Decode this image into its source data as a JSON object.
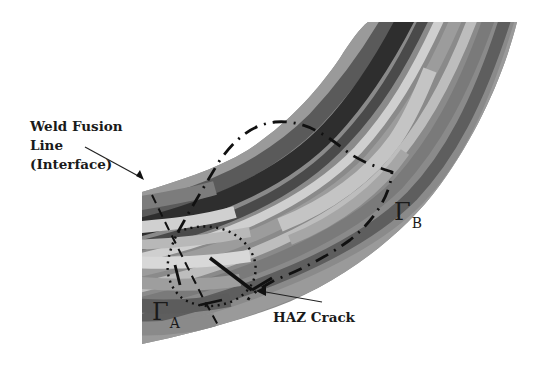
{
  "figure": {
    "labels": {
      "weld_fusion_line": [
        "Weld Fusion",
        "Line",
        "(Interface)"
      ],
      "haz_crack": "HAZ Crack",
      "gamma_b": {
        "symbol": "Γ",
        "subscript": "B"
      },
      "gamma_a": {
        "symbol": "Γ",
        "subscript": "A"
      }
    },
    "colors": {
      "background": "#ffffff",
      "ink": "#1a1a1a",
      "band_dark": "#2e2e2e",
      "band_mid_dark": "#5a5a5a",
      "band_mid": "#808080",
      "band_light": "#a8a8a8",
      "band_pale": "#cfcfcf"
    },
    "annotations": [
      {
        "name": "weld-fusion-line-arrow",
        "style": "solid-arrow"
      },
      {
        "name": "haz-crack-arrow",
        "style": "solid-arrow"
      },
      {
        "name": "contour-gamma-b",
        "style": "dash-dot"
      },
      {
        "name": "contour-gamma-a",
        "style": "dotted"
      },
      {
        "name": "fusion-line",
        "style": "dashed"
      },
      {
        "name": "crack",
        "style": "solid-thick"
      }
    ]
  }
}
